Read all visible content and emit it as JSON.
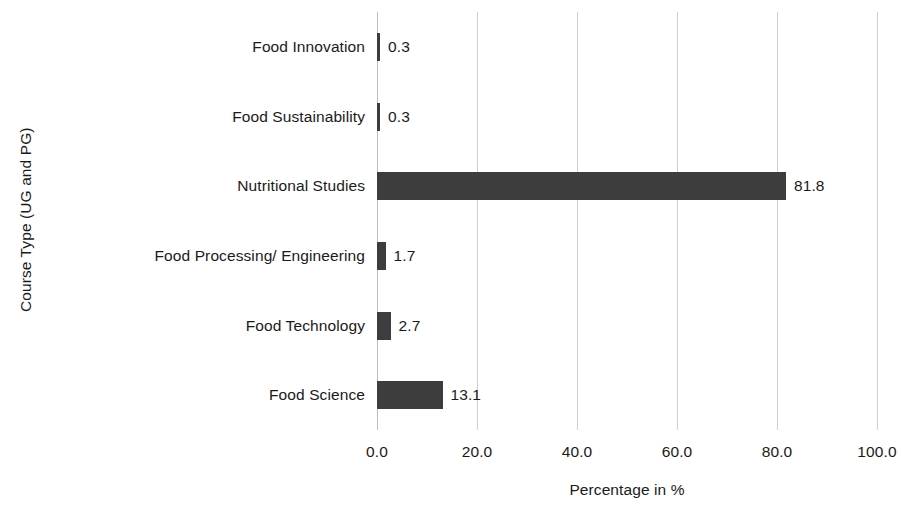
{
  "chart_data": {
    "type": "bar",
    "orientation": "horizontal",
    "title": "",
    "xlabel": "Percentage in %",
    "ylabel": "Course Type (UG and PG)",
    "categories": [
      "Food Science",
      "Food Technology",
      "Food Processing/ Engineering",
      "Nutritional Studies",
      "Food Sustainability",
      "Food Innovation"
    ],
    "values": [
      13.1,
      2.7,
      1.7,
      81.8,
      0.3,
      0.3
    ],
    "value_labels": [
      "13.1",
      "2.7",
      "1.7",
      "81.8",
      "0.3",
      "0.3"
    ],
    "xlim": [
      0,
      100
    ],
    "xticks": [
      0,
      20,
      40,
      60,
      80,
      100
    ],
    "xtick_labels": [
      "0.0",
      "20.0",
      "40.0",
      "60.0",
      "80.0",
      "100.0"
    ],
    "grid": true,
    "grid_axis": "x",
    "legend": false,
    "bar_color": "#3d3d3d",
    "gridline_color": "#cfcfcf",
    "background_color": "#ffffff"
  },
  "axes": {
    "y_title": "Course Type (UG and PG)",
    "x_title": "Percentage in %"
  },
  "categories": [
    {
      "label": "Food Innovation",
      "value": "0.3",
      "num": 0.3
    },
    {
      "label": "Food Sustainability",
      "value": "0.3",
      "num": 0.3
    },
    {
      "label": "Nutritional Studies",
      "value": "81.8",
      "num": 81.8
    },
    {
      "label": "Food Processing/ Engineering",
      "value": "1.7",
      "num": 1.7
    },
    {
      "label": "Food Technology",
      "value": "2.7",
      "num": 2.7
    },
    {
      "label": "Food Science",
      "value": "13.1",
      "num": 13.1
    }
  ],
  "xticks": [
    {
      "label": "0.0",
      "num": 0
    },
    {
      "label": "20.0",
      "num": 20
    },
    {
      "label": "40.0",
      "num": 40
    },
    {
      "label": "60.0",
      "num": 60
    },
    {
      "label": "80.0",
      "num": 80
    },
    {
      "label": "100.0",
      "num": 100
    }
  ]
}
